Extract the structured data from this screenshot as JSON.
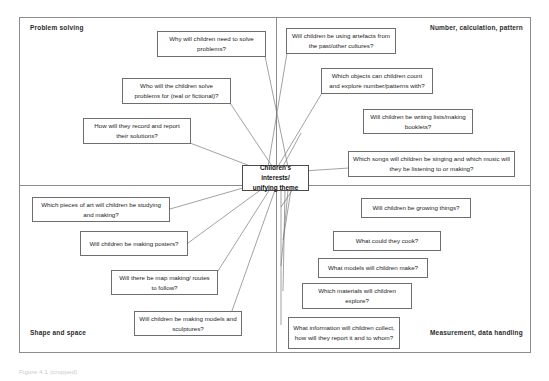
{
  "diagram": {
    "center": {
      "label": "Children's\ninterests/\nunifying theme",
      "line1": "Children's",
      "line2": "interests/",
      "line3": "unifying theme"
    },
    "quadrants": [
      {
        "key": "top-left",
        "label": "Problem solving"
      },
      {
        "key": "top-right",
        "label": "Number, calculation, pattern"
      },
      {
        "key": "bottom-left",
        "label": "Shape and space"
      },
      {
        "key": "bottom-right",
        "label": "Measurement, data handling"
      }
    ],
    "nodes": [
      {
        "id": "n1",
        "quadrant": "top-left",
        "text": "Why will children need to solve problems?"
      },
      {
        "id": "n2",
        "quadrant": "top-left",
        "text": "Who will the children solve problems for (real or fictional)?"
      },
      {
        "id": "n3",
        "quadrant": "top-left",
        "text": "How will they record and report their solutions?"
      },
      {
        "id": "n4",
        "quadrant": "top-right",
        "text": "Will children be using artefacts from the past/other cultures?"
      },
      {
        "id": "n5",
        "quadrant": "top-right",
        "text": "Which objects can children count and explore number/patterns with?"
      },
      {
        "id": "n6",
        "quadrant": "top-right",
        "text": "Will children be writing lists/making booklets?"
      },
      {
        "id": "n7",
        "quadrant": "top-right",
        "text": "Which songs will children be singing and which music will they be listening to or making?"
      },
      {
        "id": "n8",
        "quadrant": "bottom-left",
        "text": "Which pieces of art will children be studying and making?"
      },
      {
        "id": "n9",
        "quadrant": "bottom-left",
        "text": "Will children be making posters?"
      },
      {
        "id": "n10",
        "quadrant": "bottom-left",
        "text": "Will there be map making/ routes to follow?"
      },
      {
        "id": "n11",
        "quadrant": "bottom-left",
        "text": "Will children be making models and sculptures?"
      },
      {
        "id": "n12",
        "quadrant": "bottom-right",
        "text": "Will children be growing things?"
      },
      {
        "id": "n13",
        "quadrant": "bottom-right",
        "text": "What could they cook?"
      },
      {
        "id": "n14",
        "quadrant": "bottom-right",
        "text": "What models will children make?"
      },
      {
        "id": "n15",
        "quadrant": "bottom-right",
        "text": "Which materials will children explore?"
      },
      {
        "id": "n16",
        "quadrant": "bottom-right",
        "text": "What information will children collect, how will they report it and to whom?"
      }
    ],
    "caption": "Figure 4.1 (cropped)",
    "colors": {
      "border": "#8c8c8c",
      "node_border": "#6e6e6e",
      "connector": "#7a7a7a",
      "text": "#1c1c1c",
      "label_text": "#2b2b2b",
      "background": "#ffffff"
    }
  }
}
